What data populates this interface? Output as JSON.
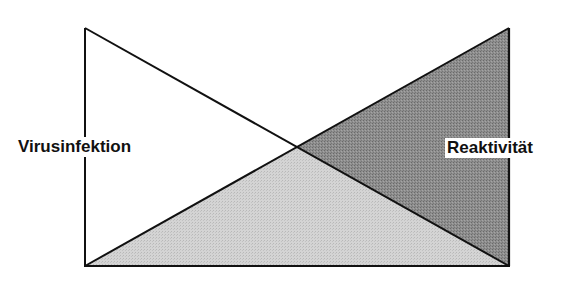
{
  "diagram": {
    "type": "crossed-triangles",
    "labels": {
      "left": "Virusinfektion",
      "right": "Reaktivität"
    },
    "colors": {
      "background": "#ffffff",
      "stroke": "#111111",
      "light_fill": "#cfcfcf",
      "dark_fill": "#8a8a8a",
      "left_fill": "#ffffff"
    },
    "geometry": {
      "left_x": 85,
      "right_x": 509,
      "top_y": 28,
      "bottom_y": 266,
      "intersection": [
        297,
        147
      ]
    },
    "regions": [
      {
        "name": "left-region",
        "fill": "white",
        "points": [
          [
            85,
            28
          ],
          [
            297,
            147
          ],
          [
            85,
            266
          ]
        ]
      },
      {
        "name": "bottom-region",
        "fill": "light-grey",
        "points": [
          [
            85,
            266
          ],
          [
            297,
            147
          ],
          [
            509,
            266
          ]
        ]
      },
      {
        "name": "right-region",
        "fill": "dark-grey",
        "points": [
          [
            509,
            28
          ],
          [
            297,
            147
          ],
          [
            509,
            266
          ]
        ]
      }
    ]
  }
}
